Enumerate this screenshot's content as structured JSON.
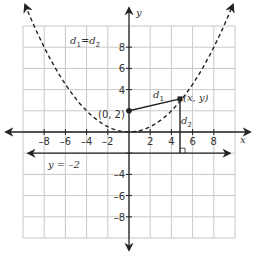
{
  "diagram": {
    "title_equation": {
      "d": "d",
      "sub1": "1",
      "eq": "=",
      "sub2": "2"
    },
    "axes": {
      "x_label": "x",
      "y_label": "y",
      "x_ticks": [
        "-8",
        "-6",
        "-4",
        "-2",
        "2",
        "4",
        "6",
        "8"
      ],
      "y_ticks": [
        "8",
        "6",
        "4",
        "-4",
        "-6",
        "-8"
      ],
      "range": {
        "xmin": -10,
        "xmax": 10,
        "ymin": -10,
        "ymax": 10
      },
      "grid_step": 2
    },
    "focus": {
      "label": "(0, 2)",
      "x": 0,
      "y": 2
    },
    "point": {
      "label": "(x, y)",
      "x": 5,
      "y": 3.125
    },
    "directrix": {
      "label": "y = –2",
      "y": -2
    },
    "segment_labels": {
      "d1": "d",
      "d1_sub": "1",
      "d2": "d",
      "d2_sub": "2"
    },
    "curve": {
      "equation": "y = x^2 / 8",
      "style": "dashed"
    },
    "colors": {
      "grid": "#c8c8c8",
      "axis": "#222222",
      "curve": "#222222",
      "text": "#333333"
    }
  }
}
